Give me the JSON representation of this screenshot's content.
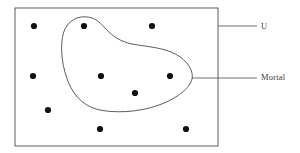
{
  "diagram": {
    "type": "euler-diagram",
    "canvas": {
      "width": 300,
      "height": 153,
      "background": "#ffffff"
    },
    "stroke_color": "#4a4a4a",
    "stroke_width": 0.9,
    "dot_color": "#111111",
    "dot_radius": 3.1,
    "universe": {
      "label": "U",
      "shape": "rectangle",
      "x": 15,
      "y": 8,
      "width": 203,
      "height": 138,
      "leader_line": {
        "x1": 218,
        "y1": 26,
        "x2": 257,
        "y2": 26
      },
      "label_position": {
        "x": 261,
        "y": 22
      }
    },
    "subset": {
      "label": "Mortal",
      "shape": "blob",
      "path": "M 85.5 16.8 C 74.0 16.2 64.5 24.0 62.4 37.5 C 60.2 51.5 62.6 68.0 68.5 82.5 C 74.5 97.5 86.0 108.0 103.0 110.6 C 122.0 113.5 145.0 111.0 163.0 103.5 C 180.0 96.4 191.8 86.0 192.3 77.0 C 192.8 67.5 184.0 57.2 171.0 52.0 C 158.0 46.8 143.0 46.2 132.0 44.0 C 120.5 41.7 112.0 36.0 105.0 28.0 C 98.5 20.6 93.5 17.2 85.5 16.8 Z",
      "leader_line": {
        "x1": 192,
        "y1": 78,
        "x2": 257,
        "y2": 78
      },
      "label_position": {
        "x": 261,
        "y": 73
      }
    },
    "points": [
      {
        "id": "p1",
        "x": 34,
        "y": 26,
        "inside_subset": false
      },
      {
        "id": "p2",
        "x": 84,
        "y": 26,
        "inside_subset": true
      },
      {
        "id": "p3",
        "x": 152,
        "y": 26,
        "inside_subset": false
      },
      {
        "id": "p4",
        "x": 33,
        "y": 76,
        "inside_subset": false
      },
      {
        "id": "p5",
        "x": 101,
        "y": 76,
        "inside_subset": true
      },
      {
        "id": "p6",
        "x": 170,
        "y": 76,
        "inside_subset": true
      },
      {
        "id": "p7",
        "x": 135,
        "y": 93,
        "inside_subset": true
      },
      {
        "id": "p8",
        "x": 48,
        "y": 110,
        "inside_subset": false
      },
      {
        "id": "p9",
        "x": 100,
        "y": 129,
        "inside_subset": false
      },
      {
        "id": "p10",
        "x": 186,
        "y": 129,
        "inside_subset": false
      }
    ]
  }
}
